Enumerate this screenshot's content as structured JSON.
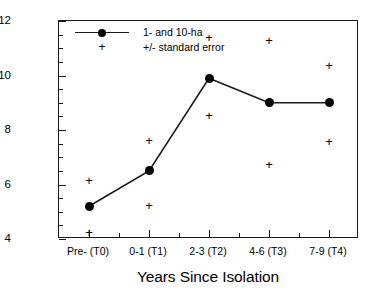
{
  "chart_data": {
    "type": "line",
    "title": "",
    "xlabel": "Years Since Isolation",
    "ylabel": "Captures/1000 Net-hours",
    "categories": [
      "Pre- (T0)",
      "0-1 (T1)",
      "2-3 (T2)",
      "4-6 (T3)",
      "7-9 (T4)"
    ],
    "ylim": [
      4,
      12
    ],
    "ytick_labels": [
      "4",
      "6",
      "8",
      "10",
      "12"
    ],
    "ytick_values": [
      4,
      6,
      8,
      10,
      12
    ],
    "yminor_step": 0.5,
    "grid": false,
    "legend_position": "top-left",
    "series": [
      {
        "name": "1- and 10-ha",
        "marker": "filled-circle",
        "values": [
          5.2,
          6.5,
          9.9,
          9.0,
          9.0
        ]
      },
      {
        "name": "+/- standard error",
        "marker": "plus",
        "upper": [
          6.15,
          7.65,
          11.4,
          11.3,
          10.4
        ],
        "lower": [
          4.25,
          5.25,
          8.55,
          6.75,
          7.6
        ]
      }
    ]
  },
  "legend": {
    "entries": [
      {
        "label": "1- and 10-ha",
        "marker": "line-circle"
      },
      {
        "label": "+/- standard error",
        "marker": "plus"
      }
    ]
  },
  "axes": {
    "y_title": "Captures/1000 Net-hours",
    "x_title": "Years Since Isolation"
  },
  "glyphs": {
    "plus": "+"
  }
}
